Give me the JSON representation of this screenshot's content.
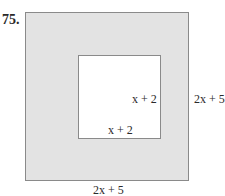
{
  "problem": {
    "number": "75."
  },
  "figure": {
    "outer_square": {
      "fill": "#e3e3e3",
      "side_label_right": "2x + 5",
      "side_label_bottom": "2x + 5"
    },
    "inner_square": {
      "fill": "#ffffff",
      "side_label_right": "x + 2",
      "side_label_bottom": "x + 2"
    }
  }
}
